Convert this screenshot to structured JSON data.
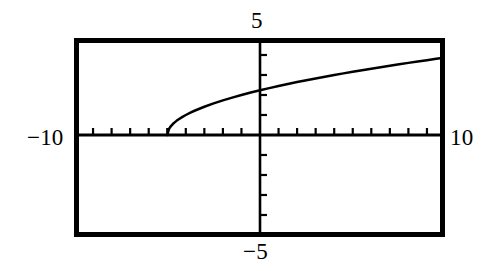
{
  "figure": {
    "name": "graphing-calculator-plot",
    "background_color": "#ffffff",
    "ink_color": "#000000"
  },
  "labels": {
    "y_max": "5",
    "y_min": "−5",
    "x_min": "−10",
    "x_max": "10"
  },
  "chart_data": {
    "type": "line",
    "title": "",
    "xlabel": "",
    "ylabel": "",
    "xlim": [
      -10,
      10
    ],
    "ylim": [
      -5,
      5
    ],
    "grid": false,
    "legend": "none",
    "axes": {
      "x_axis_at_y": 0,
      "y_axis_at_x": 0,
      "x_tick_interval": 1,
      "y_tick_interval": 1,
      "x_tick_labels": [
        "−10",
        "10"
      ],
      "y_tick_labels": [
        "−5",
        "5"
      ],
      "tick_direction": "inward",
      "frame": true
    },
    "annotations": [
      "curve begins at approximately (−5, 0)",
      "curve increases concave-down toward the right edge",
      "curve crosses the y-axis at approximately y = 2.3"
    ],
    "series": [
      {
        "name": "y = sqrt(x + 5)",
        "x": [
          -5.0,
          -4.9,
          -4.8,
          -4.7,
          -4.6,
          -4.5,
          -4.4,
          -4.2,
          -4.0,
          -3.75,
          -3.5,
          -3.0,
          -2.5,
          -2.0,
          -1.5,
          -1.0,
          -0.5,
          0.0,
          0.5,
          1.0,
          1.5,
          2.0,
          2.5,
          3.0,
          3.5,
          4.0,
          4.5,
          5.0,
          5.5,
          6.0,
          6.5,
          7.0,
          7.5,
          8.0,
          8.5,
          9.0,
          9.5,
          10.0
        ],
        "y": [
          0.0,
          0.316,
          0.447,
          0.548,
          0.632,
          0.707,
          0.775,
          0.894,
          1.0,
          1.118,
          1.225,
          1.414,
          1.581,
          1.732,
          1.871,
          2.0,
          2.121,
          2.236,
          2.345,
          2.449,
          2.55,
          2.646,
          2.739,
          2.828,
          2.915,
          3.0,
          3.082,
          3.162,
          3.24,
          3.317,
          3.391,
          3.464,
          3.536,
          3.606,
          3.674,
          3.742,
          3.808,
          3.873
        ]
      }
    ]
  },
  "geometry": {
    "frame_left_px": 74,
    "frame_top_px": 38,
    "frame_right_px": 445,
    "frame_bottom_px": 237,
    "x_axis_y_px": 135,
    "y_axis_x_px": 260,
    "unit_x_px": 18.55,
    "unit_y_px": 20.0,
    "frame_stroke_px": 5,
    "axis_stroke_px": 3,
    "curve_stroke_px": 2.4,
    "tick_len_px": 7
  }
}
